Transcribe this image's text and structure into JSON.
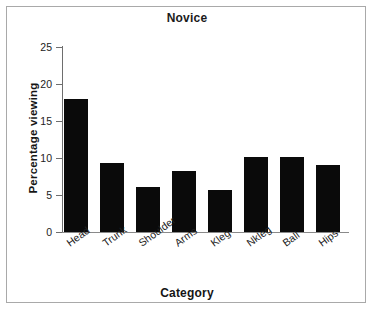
{
  "figure": {
    "background_color": "#ffffff",
    "frame_color": "#a9a9a9"
  },
  "chart_data": {
    "type": "bar",
    "title": "Novice",
    "subtitle": "",
    "xlabel": "Category",
    "ylabel": "Percentage viewing",
    "categories": [
      "Head",
      "Trunk",
      "Shoulder",
      "Arms",
      "Kleg",
      "Nkleg",
      "Ball",
      "Hips"
    ],
    "values": [
      18.0,
      9.3,
      6.1,
      8.2,
      5.7,
      10.1,
      10.1,
      9.0
    ],
    "series": [
      {
        "name": "Percentage viewing",
        "values": [
          18.0,
          9.3,
          6.1,
          8.2,
          5.7,
          10.1,
          10.1,
          9.0
        ],
        "color": "#0a0a0a"
      }
    ],
    "ylim": [
      0,
      25
    ],
    "yticks": [
      0,
      5,
      10,
      15,
      20,
      25
    ],
    "ytick_labels": [
      "0",
      "5",
      "10",
      "15",
      "20",
      "25"
    ],
    "xtick_rotation_degrees": -36,
    "grid": false,
    "legend": false,
    "legend_position": "none",
    "bar_color": "#0a0a0a",
    "axis_color": "#6e6e6e",
    "spines": [
      "left",
      "bottom"
    ]
  }
}
